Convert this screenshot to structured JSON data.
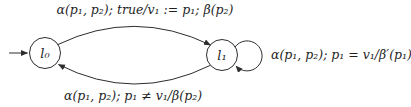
{
  "figure": {
    "background": "#ffffff",
    "line_color": "#2d2d2d",
    "text_color": "#1f1f1f"
  },
  "diagram": {
    "type": "register-automaton-state-diagram",
    "states": [
      {
        "id": "l0",
        "label": "l₀",
        "initial": true
      },
      {
        "id": "l1",
        "label": "l₁",
        "initial": false
      }
    ],
    "transitions": [
      {
        "from": "l0",
        "to": "l1",
        "position": "top-curve",
        "label": "α(p₁, p₂); true/v₁ := p₁; β(p₂)"
      },
      {
        "from": "l1",
        "to": "l0",
        "position": "bottom-curve",
        "label": "α(p₁, p₂); p₁ ≠ v₁/β(p₂)"
      },
      {
        "from": "l1",
        "to": "l1",
        "position": "right-self-loop",
        "label": "α(p₁, p₂); p₁ = v₁/β′(p₁)"
      }
    ]
  }
}
